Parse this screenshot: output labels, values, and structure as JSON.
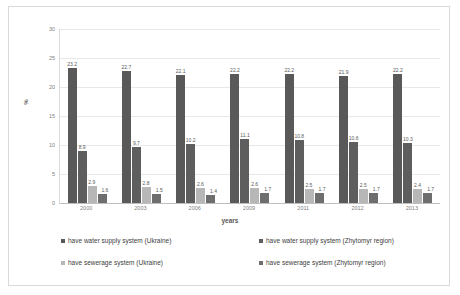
{
  "chart_data": {
    "type": "bar",
    "title": "",
    "xlabel": "years",
    "ylabel": "%",
    "ylim": [
      0,
      30
    ],
    "yticks": [
      0,
      5,
      10,
      15,
      20,
      25,
      30
    ],
    "grid": true,
    "legend_position": "bottom",
    "categories": [
      "2000",
      "2003",
      "2006",
      "2009",
      "2011",
      "2012",
      "2013"
    ],
    "series": [
      {
        "name": "have water supply system (Ukraine)",
        "color": "#595959",
        "values": [
          23.2,
          22.7,
          22.1,
          22.2,
          22.2,
          21.9,
          22.2
        ]
      },
      {
        "name": "have water supply system (Zhytomyr region)",
        "color": "#5e5e5e",
        "values": [
          8.9,
          9.7,
          10.2,
          11.1,
          10.8,
          10.6,
          10.3
        ]
      },
      {
        "name": "have sewerage system  (Ukraine)",
        "color": "#b7b7b7",
        "values": [
          2.9,
          2.8,
          2.6,
          2.6,
          2.5,
          2.5,
          2.4
        ]
      },
      {
        "name": "have sewerage system (Zhytomyr region)",
        "color": "#6e6e6e",
        "values": [
          1.6,
          1.5,
          1.4,
          1.7,
          1.7,
          1.7,
          1.7
        ]
      }
    ]
  },
  "legend": {
    "items": [
      {
        "label": "have water supply system (Ukraine)",
        "color": "#595959"
      },
      {
        "label": "have water supply system (Zhytomyr region)",
        "color": "#5e5e5e"
      },
      {
        "label": "have sewerage system  (Ukraine)",
        "color": "#b7b7b7"
      },
      {
        "label": "have sewerage system (Zhytomyr region)",
        "color": "#6e6e6e"
      }
    ]
  },
  "axes": {
    "y_title": "%",
    "x_title": "years"
  }
}
